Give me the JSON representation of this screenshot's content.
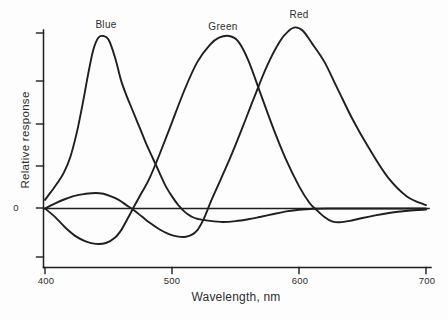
{
  "figure": {
    "background": "#fdfdfd",
    "ink_color": "#1f1f1f",
    "curve_labels": {
      "blue": "Blue",
      "green": "Green",
      "red": "Red"
    },
    "y_axis": {
      "title": "Relative response",
      "zero_tick_label": "0",
      "unlabeled_tick_count": 6
    },
    "x_axis": {
      "title": "Wavelength, nm",
      "tick_labels": [
        "400",
        "500",
        "600",
        "700"
      ]
    }
  },
  "chart_data": {
    "type": "line",
    "title": "",
    "xlabel": "Wavelength, nm",
    "ylabel": "Relative response",
    "x_range_nm": [
      400,
      700
    ],
    "x_tick_values": [
      400,
      500,
      600,
      700
    ],
    "y_axis_numbering": "only zero labeled; 6 unlabeled ticks",
    "ylim": [
      -0.35,
      1.1
    ],
    "grid": false,
    "legend_position": "inline labels above each peak",
    "series": [
      {
        "name": "Blue",
        "peak_nm": 446,
        "x": [
          400,
          405,
          410,
          415,
          420,
          425,
          430,
          434,
          438,
          442,
          446,
          450,
          455,
          460,
          465,
          470,
          475,
          480,
          485,
          490,
          495,
          500,
          505,
          510,
          515,
          520,
          530,
          540,
          550,
          560,
          570,
          580,
          590,
          600,
          612,
          625,
          650,
          675,
          700
        ],
        "y": [
          0.05,
          0.1,
          0.15,
          0.21,
          0.3,
          0.44,
          0.62,
          0.78,
          0.92,
          0.99,
          1.0,
          0.98,
          0.88,
          0.74,
          0.64,
          0.55,
          0.46,
          0.37,
          0.29,
          0.21,
          0.13,
          0.07,
          0.02,
          -0.02,
          -0.045,
          -0.06,
          -0.072,
          -0.078,
          -0.073,
          -0.062,
          -0.048,
          -0.032,
          -0.017,
          -0.007,
          -0.002,
          0,
          0,
          0,
          0
        ]
      },
      {
        "name": "Green",
        "peak_nm": 545,
        "x": [
          400,
          408,
          416,
          424,
          432,
          440,
          448,
          455,
          460,
          465,
          470,
          476,
          482,
          490,
          500,
          510,
          520,
          530,
          537,
          545,
          552,
          560,
          570,
          580,
          590,
          600,
          608,
          614,
          620,
          626,
          632,
          640,
          650,
          660,
          672,
          686,
          700
        ],
        "y": [
          0,
          -0.05,
          -0.11,
          -0.16,
          -0.19,
          -0.205,
          -0.2,
          -0.17,
          -0.125,
          -0.06,
          0.01,
          0.09,
          0.17,
          0.31,
          0.5,
          0.69,
          0.85,
          0.95,
          0.99,
          1.0,
          0.97,
          0.86,
          0.66,
          0.46,
          0.28,
          0.13,
          0.035,
          -0.01,
          -0.05,
          -0.075,
          -0.08,
          -0.072,
          -0.055,
          -0.04,
          -0.025,
          -0.013,
          -0.006
        ]
      },
      {
        "name": "Red",
        "peak_nm": 597,
        "x": [
          400,
          408,
          416,
          424,
          432,
          440,
          446,
          452,
          458,
          464,
          470,
          476,
          482,
          490,
          498,
          505,
          510,
          515,
          520,
          525,
          530,
          536,
          545,
          555,
          565,
          575,
          585,
          592,
          597,
          603,
          610,
          620,
          630,
          642,
          655,
          670,
          685,
          700
        ],
        "y": [
          0,
          0.03,
          0.055,
          0.075,
          0.085,
          0.09,
          0.085,
          0.07,
          0.05,
          0.02,
          -0.01,
          -0.045,
          -0.08,
          -0.12,
          -0.15,
          -0.163,
          -0.165,
          -0.155,
          -0.125,
          -0.06,
          0.03,
          0.13,
          0.28,
          0.46,
          0.65,
          0.83,
          0.97,
          1.03,
          1.05,
          1.03,
          0.96,
          0.85,
          0.7,
          0.52,
          0.35,
          0.18,
          0.07,
          0.02
        ]
      }
    ]
  }
}
